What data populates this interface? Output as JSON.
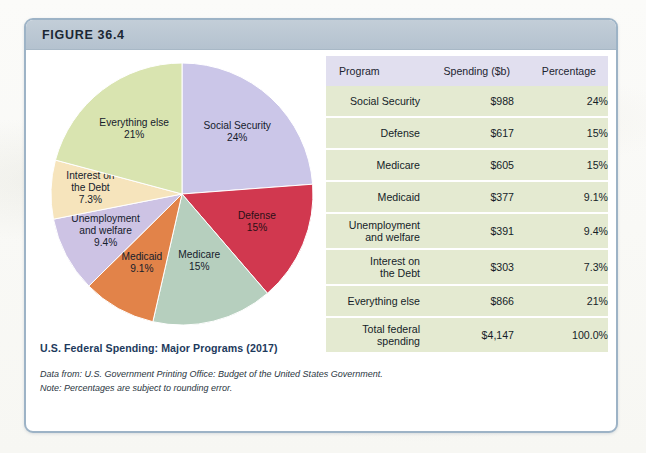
{
  "figure": {
    "header_label": "FIGURE 36.4",
    "caption": "U.S. Federal Spending: Major Programs (2017)",
    "note_data": "Data from: U.S. Government Printing Office: Budget of the United States Government.",
    "note_rounding": "Note: Percentages are subject to rounding error."
  },
  "table": {
    "headers": {
      "program": "Program",
      "spending": "Spending ($b)",
      "percentage": "Percentage"
    },
    "rows": [
      {
        "program": "Social Security",
        "spending": "$988",
        "percentage": "24%"
      },
      {
        "program": "Defense",
        "spending": "$617",
        "percentage": "15%"
      },
      {
        "program": "Medicare",
        "spending": "$605",
        "percentage": "15%"
      },
      {
        "program": "Medicaid",
        "spending": "$377",
        "percentage": "9.1%"
      },
      {
        "program_line1": "Unemployment",
        "program_line2": "and welfare",
        "spending": "$391",
        "percentage": "9.4%"
      },
      {
        "program_line1": "Interest on",
        "program_line2": "the Debt",
        "spending": "$303",
        "percentage": "7.3%"
      },
      {
        "program": "Everything else",
        "spending": "$866",
        "percentage": "21%"
      },
      {
        "program_line1": "Total federal",
        "program_line2": "spending",
        "spending": "$4,147",
        "percentage": "100.0%"
      }
    ]
  },
  "chart_data": {
    "type": "pie",
    "title": "U.S. Federal Spending: Major Programs (2017)",
    "unit": "billions of dollars",
    "start_angle_deg": 0,
    "direction": "clockwise",
    "legend": "none-inline-labels",
    "categories": [
      "Social Security",
      "Defense",
      "Medicare",
      "Medicaid",
      "Unemployment and welfare",
      "Interest on the Debt",
      "Everything else"
    ],
    "values": [
      988,
      617,
      605,
      377,
      391,
      303,
      866
    ],
    "percentages": [
      24,
      15,
      15,
      9.1,
      9.4,
      7.3,
      21
    ],
    "percent_labels": [
      "24%",
      "15%",
      "15%",
      "9.1%",
      "9.4%",
      "7.3%",
      "21%"
    ],
    "total_value": 4147,
    "total_percent_label": "100.0%",
    "colors": [
      "#cbc6e8",
      "#d1384f",
      "#b6cfbe",
      "#e28349",
      "#cdc3e4",
      "#f6e4bc",
      "#d9e4b0"
    ],
    "slice_labels": [
      {
        "name": "Social Security",
        "line1": "Social Security",
        "line2": "24%"
      },
      {
        "name": "Defense",
        "line1": "Defense",
        "line2": "15%"
      },
      {
        "name": "Medicare",
        "line1": "Medicare",
        "line2": "15%"
      },
      {
        "name": "Medicaid",
        "line1": "Medicaid",
        "line2": "9.1%"
      },
      {
        "name": "Unemployment and welfare",
        "line1": "Unemployment",
        "line2": "and welfare",
        "line3": "9.4%"
      },
      {
        "name": "Interest on the Debt",
        "line1": "Interest on",
        "line2": "the Debt",
        "line3": "7.3%"
      },
      {
        "name": "Everything else",
        "line1": "Everything else",
        "line2": "21%"
      }
    ]
  }
}
